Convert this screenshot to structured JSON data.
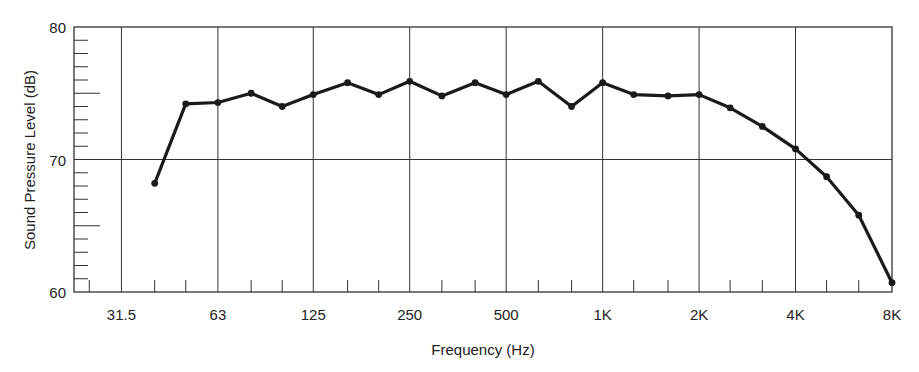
{
  "chart_data": {
    "type": "line",
    "title": "",
    "xlabel": "Frequency (Hz)",
    "ylabel": "Sound Pressure Level (dB)",
    "x_scale": "log (octave bands)",
    "x_tick_labels": [
      "31.5",
      "63",
      "125",
      "250",
      "500",
      "1K",
      "2K",
      "4K",
      "8K"
    ],
    "x_tick_values": [
      31.5,
      63,
      125,
      250,
      500,
      1000,
      2000,
      4000,
      8000
    ],
    "y_tick_labels": [
      "60",
      "70",
      "80"
    ],
    "y_tick_values": [
      60,
      70,
      80
    ],
    "ylim": [
      60,
      80
    ],
    "xlim": [
      22.4,
      8000
    ],
    "grid": true,
    "legend": null,
    "series": [
      {
        "name": "SPL",
        "x": [
          40,
          50,
          63,
          80,
          100,
          125,
          160,
          200,
          250,
          315,
          400,
          500,
          630,
          800,
          1000,
          1250,
          1600,
          2000,
          2500,
          3150,
          4000,
          5000,
          6300,
          8000
        ],
        "values": [
          68.2,
          74.2,
          74.3,
          75.0,
          74.0,
          74.9,
          75.8,
          74.9,
          75.9,
          74.8,
          75.8,
          74.9,
          75.9,
          74.0,
          75.8,
          74.9,
          74.8,
          74.9,
          73.9,
          72.5,
          70.8,
          68.7,
          65.8,
          60.7
        ],
        "color": "#1a1a1a"
      }
    ]
  }
}
